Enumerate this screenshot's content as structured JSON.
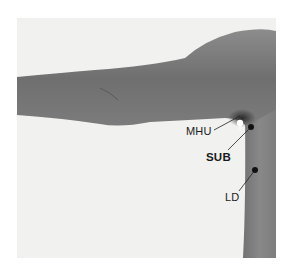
{
  "figure": {
    "background_color": "#f1f1f0",
    "skin_color": "#7a7a7a",
    "points": [
      {
        "id": "mhu",
        "label": "MHU",
        "marker": "white",
        "bold": false
      },
      {
        "id": "sub",
        "label": "SUB",
        "marker": "black",
        "bold": true
      },
      {
        "id": "ld",
        "label": "LD",
        "marker": "black",
        "bold": false
      }
    ]
  }
}
